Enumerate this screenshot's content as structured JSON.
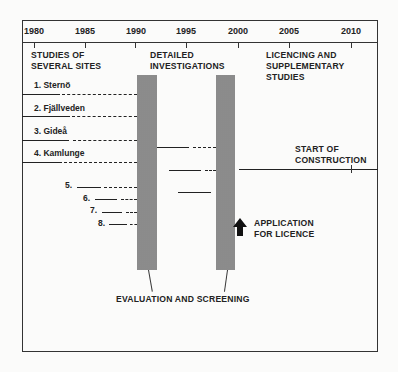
{
  "timeline": {
    "years": [
      "1980",
      "1985",
      "1990",
      "1995",
      "2000",
      "2005",
      "2010"
    ]
  },
  "phases": {
    "studies": [
      "STUDIES OF",
      "SEVERAL SITES"
    ],
    "detailed": [
      "DETAILED",
      "INVESTIGATIONS"
    ],
    "licencing": [
      "LICENCING AND",
      "SUPPLEMENTARY",
      "STUDIES"
    ]
  },
  "sites": [
    "1. Sternö",
    "2. Fjällveden",
    "3. Gideå",
    "4. Kamlunge",
    "5.",
    "6.",
    "7.",
    "8."
  ],
  "annotations": {
    "construction": [
      "START OF",
      "CONSTRUCTION"
    ],
    "application": [
      "APPLICATION",
      "FOR LICENCE"
    ],
    "evaluation": "EVALUATION AND SCREENING"
  }
}
